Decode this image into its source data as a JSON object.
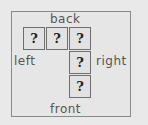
{
  "labels": {
    "back": "back",
    "left": "left",
    "right": "right",
    "front": "front"
  },
  "cells": [
    {
      "text": "?"
    },
    {
      "text": "?"
    },
    {
      "text": "?"
    },
    {
      "text": "?"
    },
    {
      "text": "?"
    }
  ]
}
